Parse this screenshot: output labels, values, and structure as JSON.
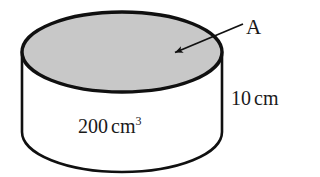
{
  "figure": {
    "shape": "cylinder",
    "top_face_label": "A",
    "top_face_fill": "#c8c8c8",
    "body_fill": "#ffffff",
    "outline_color": "#101010",
    "geometry": {
      "top_ellipse_cx": 122,
      "top_ellipse_cy": 52,
      "top_ellipse_rx": 100,
      "top_ellipse_ry": 40,
      "body_bottom_cy": 132,
      "body_bottom_ry": 40,
      "side_left_x": 22,
      "side_right_x": 222
    },
    "arrow": {
      "from_x": 242,
      "from_y": 25,
      "to_x": 174,
      "to_y": 53
    }
  },
  "labels": {
    "area_label": "A",
    "height_value": "10",
    "height_unit": "cm",
    "volume_value": "200",
    "volume_unit": "cm",
    "volume_exponent": "3"
  }
}
